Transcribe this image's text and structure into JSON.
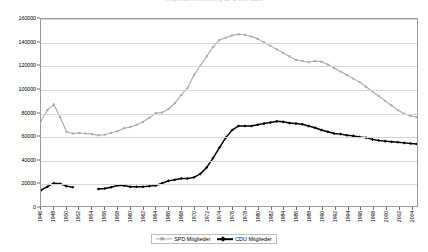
{
  "chart_data": {
    "type": "line",
    "title": "Mitgliederentwicklung SPD und CDU",
    "xlabel": "",
    "ylabel": "",
    "ylim": [
      0,
      160000
    ],
    "ytick_step": 20000,
    "yticks": [
      "0",
      "20000",
      "40000",
      "60000",
      "80000",
      "100000",
      "120000",
      "140000",
      "160000"
    ],
    "xlim": [
      1946,
      2005
    ],
    "xtick_step": 2,
    "grid": true,
    "legend_position": "bottom-center",
    "categories": [
      1946,
      1947,
      1948,
      1949,
      1950,
      1951,
      1952,
      1953,
      1954,
      1955,
      1956,
      1957,
      1958,
      1959,
      1960,
      1961,
      1962,
      1963,
      1964,
      1965,
      1966,
      1967,
      1968,
      1969,
      1970,
      1971,
      1972,
      1973,
      1974,
      1975,
      1976,
      1977,
      1978,
      1979,
      1980,
      1981,
      1982,
      1983,
      1984,
      1985,
      1986,
      1987,
      1988,
      1989,
      1990,
      1991,
      1992,
      1993,
      1994,
      1995,
      1996,
      1997,
      1998,
      1999,
      2000,
      2001,
      2002,
      2003,
      2004,
      2005
    ],
    "series": [
      {
        "name": "SPD Mitglieder",
        "color": "#a9a9a9",
        "marker": "square",
        "values": [
          73000,
          82000,
          87000,
          76000,
          63500,
          62000,
          62500,
          62000,
          61500,
          60500,
          61000,
          62500,
          64000,
          66500,
          67500,
          69500,
          72000,
          75500,
          79500,
          80000,
          83000,
          88000,
          95000,
          101000,
          112000,
          120000,
          128000,
          136000,
          142000,
          144000,
          146000,
          147000,
          146500,
          145000,
          143000,
          140000,
          137000,
          134000,
          131000,
          128000,
          125000,
          124000,
          123000,
          124000,
          123500,
          121000,
          118000,
          115000,
          112000,
          109000,
          106000,
          102000,
          98000,
          94000,
          90000,
          86000,
          82000,
          79000,
          77000,
          76000
        ]
      },
      {
        "name": "CDU Mitglieder",
        "color": "#000000",
        "marker": "diamond",
        "values": [
          13500,
          16500,
          19500,
          19000,
          17000,
          16000,
          null,
          null,
          null,
          14500,
          15000,
          16000,
          17500,
          17500,
          16500,
          16500,
          16500,
          17000,
          17500,
          19500,
          21500,
          22500,
          23500,
          23500,
          24500,
          27500,
          33000,
          41000,
          50000,
          58500,
          65000,
          68500,
          68500,
          68500,
          69500,
          70500,
          71500,
          72500,
          72000,
          71000,
          70500,
          70000,
          68500,
          67000,
          65000,
          63500,
          62000,
          61500,
          60500,
          60000,
          59000,
          58500,
          57000,
          56000,
          55500,
          55000,
          54500,
          54000,
          53500,
          53000
        ]
      }
    ]
  },
  "legend": {
    "entries": [
      {
        "label": "SPD Mitglieder"
      },
      {
        "label": "CDU Mitglieder"
      }
    ]
  }
}
